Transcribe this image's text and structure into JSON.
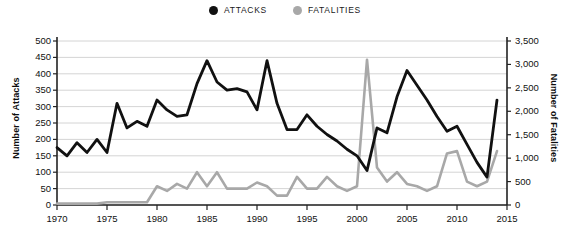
{
  "legend": {
    "items": [
      {
        "label": "ATTACKS",
        "color": "#111111",
        "icon": "circle-marker-icon"
      },
      {
        "label": "FATALITIES",
        "color": "#a8a8a8",
        "icon": "circle-marker-icon"
      }
    ]
  },
  "axes": {
    "left_title": "Number of Attacks",
    "right_title": "Number of Fatalities",
    "left_ticks": [
      "500",
      "450",
      "400",
      "350",
      "300",
      "250",
      "200",
      "150",
      "100",
      "50",
      "0"
    ],
    "right_ticks": [
      "3,500",
      "3,000",
      "2,500",
      "2,000",
      "1,500",
      "1,000",
      "500",
      "0"
    ],
    "x_ticks": [
      "1970",
      "1975",
      "1980",
      "1985",
      "1990",
      "1995",
      "2000",
      "2005",
      "2010",
      "2015"
    ]
  },
  "chart_data": {
    "type": "line",
    "title": "",
    "xlabel": "",
    "ylabel": "Number of Attacks",
    "y2label": "Number of Fatalities",
    "xlim": [
      1970,
      2015
    ],
    "ylim": [
      0,
      500
    ],
    "y2lim": [
      0,
      3500
    ],
    "grid": true,
    "legend_position": "top-center",
    "x": [
      1970,
      1971,
      1972,
      1973,
      1974,
      1975,
      1976,
      1977,
      1978,
      1979,
      1980,
      1981,
      1982,
      1983,
      1984,
      1985,
      1986,
      1987,
      1988,
      1989,
      1990,
      1991,
      1992,
      1993,
      1994,
      1995,
      1996,
      1997,
      1998,
      1999,
      2000,
      2001,
      2002,
      2003,
      2004,
      2005,
      2006,
      2007,
      2008,
      2009,
      2010,
      2011,
      2012,
      2013,
      2014
    ],
    "series": [
      {
        "name": "ATTACKS",
        "color": "#111111",
        "axis": "left",
        "values": [
          175,
          150,
          190,
          160,
          200,
          160,
          310,
          235,
          255,
          240,
          320,
          290,
          270,
          275,
          370,
          440,
          375,
          350,
          355,
          345,
          290,
          440,
          310,
          230,
          230,
          275,
          240,
          215,
          195,
          170,
          150,
          105,
          235,
          220,
          330,
          410,
          365,
          320,
          270,
          225,
          240,
          185,
          130,
          85,
          320
        ]
      },
      {
        "name": "FATALITIES",
        "color": "#a8a8a8",
        "axis": "right",
        "values": [
          30,
          30,
          30,
          30,
          30,
          60,
          60,
          60,
          60,
          60,
          400,
          300,
          450,
          350,
          700,
          400,
          700,
          350,
          350,
          350,
          480,
          400,
          200,
          200,
          600,
          350,
          350,
          600,
          400,
          300,
          400,
          3100,
          800,
          500,
          700,
          450,
          400,
          300,
          400,
          1100,
          1150,
          500,
          400,
          500,
          1150
        ]
      }
    ]
  }
}
